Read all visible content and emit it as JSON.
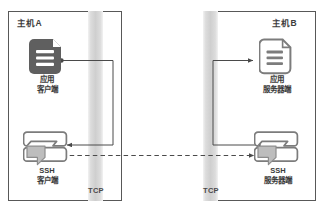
{
  "page": {
    "top_clipped_text": "————————————————"
  },
  "diagram": {
    "hosts": [
      {
        "id": "host-a",
        "label": "主机A"
      },
      {
        "id": "host-b",
        "label": "主机B"
      }
    ],
    "channels": [
      {
        "id": "tcp-left",
        "label": "TCP"
      },
      {
        "id": "tcp-right",
        "label": "TCP"
      }
    ],
    "nodes": [
      {
        "id": "app-client",
        "icon": "document-filled-icon",
        "line1": "应用",
        "line2": "客户端"
      },
      {
        "id": "app-server",
        "icon": "document-outline-icon",
        "line1": "应用",
        "line2": "服务器端"
      },
      {
        "id": "ssh-client",
        "icon": "ssh-tunnel-icon",
        "line1": "SSH",
        "line2": "客户端"
      },
      {
        "id": "ssh-server",
        "icon": "ssh-tunnel-icon",
        "line1": "SSH",
        "line2": "服务器端"
      }
    ],
    "connections": [
      {
        "id": "app-client-to-ssh-client",
        "style": "solid",
        "from": "app-client",
        "to": "ssh-client"
      },
      {
        "id": "ssh-client-to-ssh-server",
        "style": "dashed",
        "from": "ssh-client",
        "to": "ssh-server"
      },
      {
        "id": "ssh-server-to-app-server",
        "style": "solid",
        "from": "ssh-server",
        "to": "app-server"
      }
    ],
    "colors": {
      "border": "#585858",
      "line": "#4a4a4a",
      "icon_dark_fill": "#5f5f5f",
      "icon_outline": "#7a7a7a",
      "tcp_band": "#cfcfcf",
      "text": "#3a3a3a"
    }
  }
}
